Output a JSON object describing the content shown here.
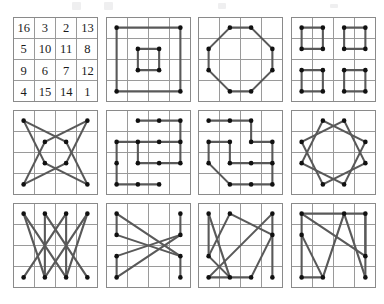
{
  "figure": {
    "panel_columns": 4,
    "panel_rows": 3,
    "grid_size": 4,
    "colors": {
      "grid_line": "#9a9a9a",
      "grid_border": "#8a8a8a",
      "path_stroke": "#595959",
      "node_fill": "#111111",
      "background": "#ffffff",
      "number_fill": "#1a1a1a"
    },
    "layout": {
      "panel_size_px": 85,
      "cell_size_px": 21.25,
      "origin_x": 13,
      "origin_y": 17,
      "step_x": 92.5,
      "step_y": 93,
      "canvas_width": 384,
      "canvas_height": 304
    }
  },
  "magic_square": {
    "name": "durer-magic-square",
    "rows": [
      [
        16,
        3,
        2,
        13
      ],
      [
        5,
        10,
        11,
        8
      ],
      [
        9,
        6,
        7,
        12
      ],
      [
        4,
        15,
        14,
        1
      ]
    ],
    "magic_constant": 34
  },
  "panels": [
    {
      "index": 1,
      "name": "magic-square-numbers",
      "kind": "numbers",
      "row": 0,
      "col": 0,
      "nodes": [],
      "edges": []
    },
    {
      "index": 2,
      "name": "concentric-squares",
      "kind": "paths",
      "row": 0,
      "col": 1,
      "nodes": [
        [
          0,
          0
        ],
        [
          3,
          0
        ],
        [
          3,
          3
        ],
        [
          0,
          3
        ],
        [
          1,
          1
        ],
        [
          2,
          1
        ],
        [
          2,
          2
        ],
        [
          1,
          2
        ]
      ],
      "edges": [
        [
          0,
          1
        ],
        [
          1,
          2
        ],
        [
          2,
          3
        ],
        [
          3,
          0
        ],
        [
          4,
          5
        ],
        [
          5,
          6
        ],
        [
          6,
          7
        ],
        [
          7,
          4
        ]
      ]
    },
    {
      "index": 3,
      "name": "octagon-edge-cells",
      "kind": "paths",
      "row": 0,
      "col": 2,
      "nodes": [
        [
          1,
          0
        ],
        [
          2,
          0
        ],
        [
          3,
          1
        ],
        [
          3,
          2
        ],
        [
          2,
          3
        ],
        [
          1,
          3
        ],
        [
          0,
          2
        ],
        [
          0,
          1
        ]
      ],
      "edges": [
        [
          0,
          1
        ],
        [
          1,
          2
        ],
        [
          2,
          3
        ],
        [
          3,
          4
        ],
        [
          4,
          5
        ],
        [
          5,
          6
        ],
        [
          6,
          7
        ],
        [
          7,
          0
        ]
      ]
    },
    {
      "index": 4,
      "name": "four-quadrant-squares",
      "kind": "paths",
      "row": 0,
      "col": 3,
      "nodes": [
        [
          0,
          0
        ],
        [
          1,
          0
        ],
        [
          1,
          1
        ],
        [
          0,
          1
        ],
        [
          2,
          0
        ],
        [
          3,
          0
        ],
        [
          3,
          1
        ],
        [
          2,
          1
        ],
        [
          0,
          2
        ],
        [
          1,
          2
        ],
        [
          1,
          3
        ],
        [
          0,
          3
        ],
        [
          2,
          2
        ],
        [
          3,
          2
        ],
        [
          3,
          3
        ],
        [
          2,
          3
        ]
      ],
      "edges": [
        [
          0,
          1
        ],
        [
          1,
          2
        ],
        [
          2,
          3
        ],
        [
          3,
          0
        ],
        [
          4,
          5
        ],
        [
          5,
          6
        ],
        [
          6,
          7
        ],
        [
          7,
          4
        ],
        [
          8,
          9
        ],
        [
          9,
          10
        ],
        [
          10,
          11
        ],
        [
          11,
          8
        ],
        [
          12,
          13
        ],
        [
          13,
          14
        ],
        [
          14,
          15
        ],
        [
          15,
          12
        ]
      ]
    },
    {
      "index": 5,
      "name": "eight-point-star",
      "kind": "paths",
      "row": 1,
      "col": 0,
      "nodes": [
        [
          0,
          0
        ],
        [
          1,
          1
        ],
        [
          2,
          1
        ],
        [
          3,
          0
        ],
        [
          3,
          3
        ],
        [
          2,
          2
        ],
        [
          1,
          2
        ],
        [
          0,
          3
        ]
      ],
      "edges": [
        [
          0,
          2
        ],
        [
          2,
          4
        ],
        [
          4,
          6
        ],
        [
          6,
          0
        ],
        [
          3,
          1
        ],
        [
          1,
          7
        ],
        [
          7,
          5
        ],
        [
          5,
          3
        ]
      ]
    },
    {
      "index": 6,
      "name": "pinwheel-pattern-a",
      "kind": "paths",
      "row": 1,
      "col": 1,
      "nodes": [
        [
          1,
          0
        ],
        [
          2,
          0
        ],
        [
          3,
          0
        ],
        [
          3,
          1
        ],
        [
          3,
          2
        ],
        [
          2,
          2
        ],
        [
          1,
          1
        ],
        [
          0,
          1
        ],
        [
          0,
          2
        ],
        [
          0,
          3
        ],
        [
          1,
          3
        ],
        [
          2,
          1
        ],
        [
          1,
          2
        ],
        [
          2,
          3
        ]
      ],
      "edges": [
        [
          0,
          1
        ],
        [
          1,
          2
        ],
        [
          2,
          3
        ],
        [
          3,
          4
        ],
        [
          4,
          5
        ],
        [
          5,
          12
        ],
        [
          12,
          6
        ],
        [
          6,
          7
        ],
        [
          7,
          8
        ],
        [
          8,
          9
        ],
        [
          9,
          10
        ],
        [
          10,
          13
        ],
        [
          11,
          3
        ],
        [
          11,
          6
        ]
      ]
    },
    {
      "index": 7,
      "name": "pinwheel-pattern-b",
      "kind": "paths",
      "row": 1,
      "col": 2,
      "nodes": [
        [
          0,
          0
        ],
        [
          1,
          0
        ],
        [
          2,
          0
        ],
        [
          2,
          1
        ],
        [
          3,
          1
        ],
        [
          3,
          2
        ],
        [
          2,
          2
        ],
        [
          1,
          2
        ],
        [
          1,
          1
        ],
        [
          0,
          1
        ],
        [
          0,
          2
        ],
        [
          1,
          3
        ],
        [
          2,
          3
        ],
        [
          3,
          3
        ]
      ],
      "edges": [
        [
          0,
          1
        ],
        [
          1,
          2
        ],
        [
          2,
          3
        ],
        [
          3,
          4
        ],
        [
          4,
          5
        ],
        [
          5,
          6
        ],
        [
          6,
          7
        ],
        [
          7,
          8
        ],
        [
          8,
          9
        ],
        [
          9,
          10
        ],
        [
          10,
          11
        ],
        [
          11,
          12
        ],
        [
          12,
          13
        ],
        [
          13,
          5
        ]
      ]
    },
    {
      "index": 8,
      "name": "twelve-point-rosette",
      "kind": "paths",
      "row": 1,
      "col": 3,
      "nodes": [
        [
          1,
          0
        ],
        [
          2,
          0
        ],
        [
          3,
          1
        ],
        [
          3,
          2
        ],
        [
          2,
          3
        ],
        [
          1,
          3
        ],
        [
          0,
          2
        ],
        [
          0,
          1
        ]
      ],
      "edges": [
        [
          0,
          2
        ],
        [
          2,
          4
        ],
        [
          4,
          6
        ],
        [
          6,
          0
        ],
        [
          1,
          3
        ],
        [
          3,
          5
        ],
        [
          5,
          7
        ],
        [
          7,
          1
        ]
      ]
    },
    {
      "index": 9,
      "name": "zigzag-top-bottom",
      "kind": "paths",
      "row": 2,
      "col": 0,
      "nodes": [
        [
          0,
          0
        ],
        [
          1,
          0
        ],
        [
          2,
          0
        ],
        [
          3,
          0
        ],
        [
          0,
          3
        ],
        [
          1,
          3
        ],
        [
          2,
          3
        ],
        [
          3,
          3
        ]
      ],
      "edges": [
        [
          0,
          6
        ],
        [
          1,
          5
        ],
        [
          1,
          7
        ],
        [
          2,
          4
        ],
        [
          2,
          6
        ],
        [
          3,
          5
        ],
        [
          0,
          5
        ],
        [
          3,
          6
        ]
      ]
    },
    {
      "index": 10,
      "name": "x-cross-columns",
      "kind": "paths",
      "row": 2,
      "col": 1,
      "nodes": [
        [
          0,
          0
        ],
        [
          0,
          1
        ],
        [
          0,
          2
        ],
        [
          0,
          3
        ],
        [
          3,
          0
        ],
        [
          3,
          1
        ],
        [
          3,
          2
        ],
        [
          3,
          3
        ]
      ],
      "edges": [
        [
          0,
          1
        ],
        [
          1,
          6
        ],
        [
          6,
          7
        ],
        [
          2,
          3
        ],
        [
          2,
          5
        ],
        [
          4,
          5
        ],
        [
          0,
          6
        ],
        [
          3,
          5
        ]
      ]
    },
    {
      "index": 11,
      "name": "tilted-quadrilaterals-a",
      "kind": "paths",
      "row": 2,
      "col": 2,
      "nodes": [
        [
          0,
          0
        ],
        [
          1,
          0
        ],
        [
          3,
          0
        ],
        [
          3,
          1
        ],
        [
          0,
          2
        ],
        [
          0,
          3
        ],
        [
          1,
          3
        ],
        [
          2,
          3
        ],
        [
          3,
          3
        ]
      ],
      "edges": [
        [
          0,
          4
        ],
        [
          1,
          3
        ],
        [
          3,
          8
        ],
        [
          4,
          1
        ],
        [
          5,
          2
        ],
        [
          2,
          3
        ],
        [
          6,
          0
        ],
        [
          7,
          3
        ],
        [
          5,
          7
        ],
        [
          4,
          6
        ]
      ]
    },
    {
      "index": 12,
      "name": "tilted-quadrilaterals-b",
      "kind": "paths",
      "row": 2,
      "col": 3,
      "nodes": [
        [
          0,
          0
        ],
        [
          2,
          0
        ],
        [
          3,
          0
        ],
        [
          0,
          1
        ],
        [
          3,
          2
        ],
        [
          0,
          3
        ],
        [
          1,
          3
        ],
        [
          3,
          3
        ]
      ],
      "edges": [
        [
          0,
          3
        ],
        [
          3,
          5
        ],
        [
          1,
          2
        ],
        [
          2,
          4
        ],
        [
          4,
          7
        ],
        [
          5,
          6
        ],
        [
          6,
          1
        ],
        [
          0,
          1
        ],
        [
          3,
          6
        ],
        [
          4,
          2
        ],
        [
          0,
          4
        ],
        [
          1,
          7
        ]
      ]
    }
  ]
}
